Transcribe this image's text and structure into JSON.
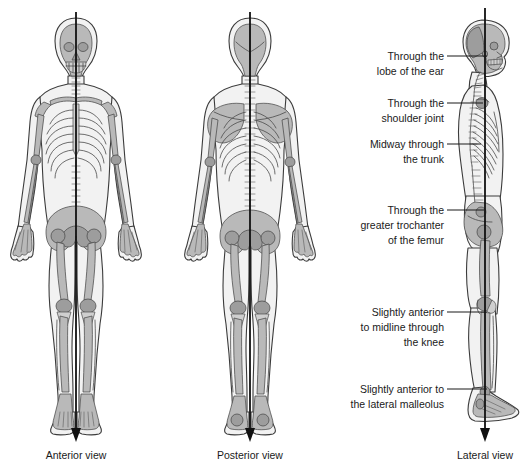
{
  "figure": {
    "background_color": "#ffffff",
    "ink_color": "#1a1a1a",
    "skin_fill": "#f2f2f2",
    "bone_fill": "#b9b9b9",
    "plumb_line_color": "#111111"
  },
  "panels": [
    {
      "id": "anterior",
      "caption": "Anterior view",
      "caption_x": 76,
      "caption_y": 455,
      "plumb_top_y": 12,
      "plumb_bottom_y": 440,
      "plumb_x": 76
    },
    {
      "id": "posterior",
      "caption": "Posterior view",
      "caption_x": 250,
      "caption_y": 455,
      "plumb_top_y": 12,
      "plumb_bottom_y": 440,
      "plumb_x": 250
    },
    {
      "id": "lateral",
      "caption": "Lateral view",
      "caption_x": 485,
      "caption_y": 455,
      "plumb_top_y": 8,
      "plumb_bottom_y": 440,
      "plumb_x": 485
    }
  ],
  "callouts": [
    {
      "id": "ear-lobe",
      "lines": [
        "Through the",
        "lobe of the ear"
      ],
      "text_anchor_x": 444,
      "text_top_y": 53,
      "leader_y": 56,
      "leader_x_start": 447,
      "leader_x_end": 487
    },
    {
      "id": "shoulder-joint",
      "lines": [
        "Through the",
        "shoulder joint"
      ],
      "text_anchor_x": 444,
      "text_top_y": 100,
      "leader_y": 103,
      "leader_x_start": 447,
      "leader_x_end": 483
    },
    {
      "id": "trunk-midway",
      "lines": [
        "Midway through",
        "the trunk"
      ],
      "text_anchor_x": 444,
      "text_top_y": 141,
      "leader_y": 144,
      "leader_x_start": 447,
      "leader_x_end": 481
    },
    {
      "id": "greater-trochanter",
      "lines": [
        "Through the",
        "greater trochanter",
        "of the femur"
      ],
      "text_anchor_x": 444,
      "text_top_y": 207,
      "leader_y": 210,
      "leader_x_start": 447,
      "leader_x_end": 484
    },
    {
      "id": "knee",
      "lines": [
        "Slightly anterior",
        "to midline through",
        "the knee"
      ],
      "text_anchor_x": 444,
      "text_top_y": 309,
      "leader_y": 312,
      "leader_x_start": 447,
      "leader_x_end": 487
    },
    {
      "id": "lateral-malleolus",
      "lines": [
        "Slightly anterior to",
        "the lateral malleolus"
      ],
      "text_anchor_x": 444,
      "text_top_y": 386,
      "leader_y": 389,
      "leader_x_start": 447,
      "leader_x_end": 487
    }
  ]
}
